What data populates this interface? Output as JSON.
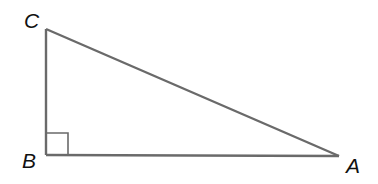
{
  "diagram": {
    "type": "right-triangle",
    "stroke_color": "#6a6a6a",
    "label_color": "#111111",
    "vertices": {
      "A": {
        "label": "A",
        "x": 339,
        "y": 156
      },
      "B": {
        "label": "B",
        "x": 46,
        "y": 155
      },
      "C": {
        "label": "C",
        "x": 46,
        "y": 29
      }
    },
    "right_angle_at": "B",
    "right_angle_marker_size": 22
  }
}
